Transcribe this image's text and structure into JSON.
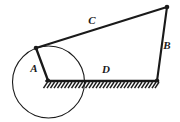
{
  "figure": {
    "background_color": "#ffffff",
    "line_color": "#1a1a1a",
    "width": 180,
    "height": 122
  },
  "labels": {
    "link_a": "A",
    "link_b": "B",
    "link_c": "C",
    "link_d": "D"
  },
  "geometry": {
    "joints": {
      "ground_left": {
        "x": 48,
        "y": 80
      },
      "ground_right": {
        "x": 157,
        "y": 80
      },
      "coupler_left": {
        "x": 36,
        "y": 48
      },
      "coupler_right": {
        "x": 167,
        "y": 7
      }
    },
    "links": {
      "A": {
        "from": "ground_left",
        "to": "coupler_left"
      },
      "B": {
        "from": "coupler_right",
        "to": "ground_right"
      },
      "C": {
        "from": "coupler_left",
        "to": "coupler_right"
      },
      "D": {
        "from": "ground_left",
        "to": "ground_right"
      }
    },
    "crank_circle": {
      "cx": 48.5,
      "cy": 82,
      "r": 36
    },
    "ground_hatch": {
      "x_start": 46,
      "x_end": 158,
      "y": 82,
      "spacing": 3.4,
      "length": 6
    }
  },
  "label_positions": {
    "A": {
      "x": 34,
      "y": 72
    },
    "B": {
      "x": 166,
      "y": 48
    },
    "C": {
      "x": 92,
      "y": 23
    },
    "D": {
      "x": 105,
      "y": 72
    }
  }
}
